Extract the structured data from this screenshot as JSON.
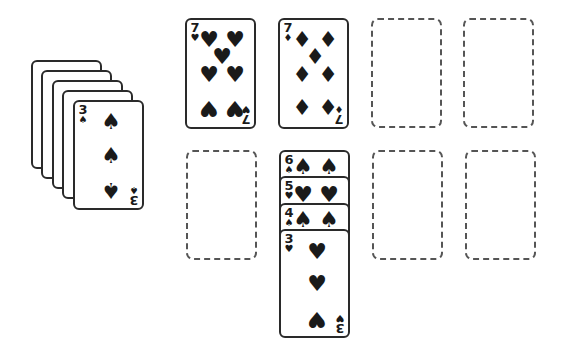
{
  "game": {
    "colors": {
      "ink": "#1a1a1a",
      "card_border": "#2a2a2a",
      "slot_border": "#555555",
      "background": "#ffffff"
    },
    "stock": {
      "face_down_count": 4,
      "top_card": {
        "rank": "3",
        "suit": "spade",
        "symbol": "♠"
      }
    },
    "foundations_top": [
      {
        "rank": "7",
        "suit": "heart",
        "symbol": "♥"
      },
      {
        "rank": "7",
        "suit": "diamond",
        "symbol": "♦"
      },
      {
        "empty": true
      },
      {
        "empty": true
      }
    ],
    "tableau": [
      {
        "empty": true
      },
      {
        "cards": [
          {
            "rank": "6",
            "suit": "spade",
            "symbol": "♠"
          },
          {
            "rank": "5",
            "suit": "heart",
            "symbol": "♥"
          },
          {
            "rank": "4",
            "suit": "spade",
            "symbol": "♠"
          },
          {
            "rank": "3",
            "suit": "heart",
            "symbol": "♥"
          }
        ]
      },
      {
        "empty": true
      },
      {
        "empty": true
      }
    ]
  }
}
